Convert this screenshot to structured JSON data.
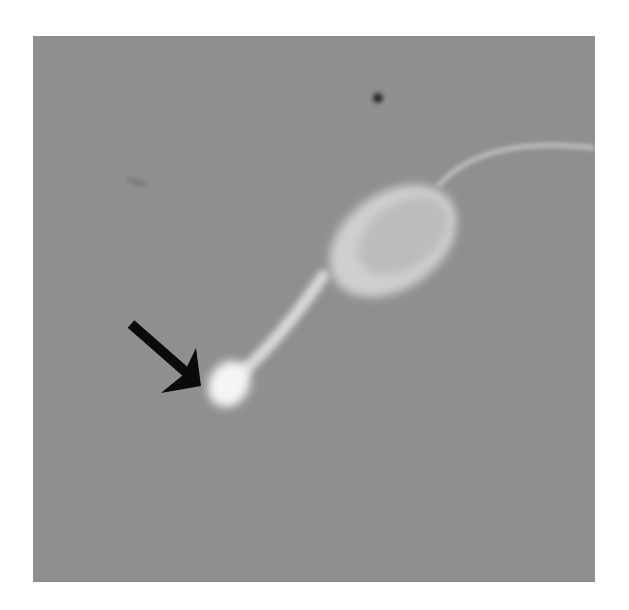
{
  "image": {
    "kind": "grayscale micrograph",
    "subject": "sperm cell with head, midpiece, and tail",
    "annotation": "black arrow pointing to bright droplet at end of midpiece",
    "colors": {
      "page_background": "#ffffff",
      "field_background": "#8f8f8f",
      "cell": "#e6e6e6",
      "droplet": "#f7f7f7",
      "arrow": "#0a0a0a",
      "debris_dot": "#2a2a2a"
    }
  }
}
